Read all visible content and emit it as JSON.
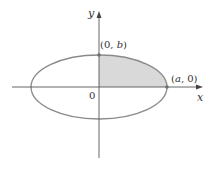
{
  "figure": {
    "type": "ellipse-diagram",
    "axes": {
      "x_label": "x",
      "y_label": "y",
      "origin_label": "0"
    },
    "points": [
      {
        "name": "top-vertex",
        "label_pre": "(0, ",
        "label_var": "b",
        "label_post": ")"
      },
      {
        "name": "right-vertex",
        "label_pre": "(",
        "label_var": "a",
        "label_post": ", 0)"
      }
    ],
    "shaded_region": "first quadrant of ellipse",
    "colors": {
      "ellipse_stroke": "#8a8a8a",
      "axis_stroke": "#555555",
      "shade_fill": "#d9d9d9",
      "point_fill": "#6e6e6e",
      "text": "#333333"
    }
  }
}
